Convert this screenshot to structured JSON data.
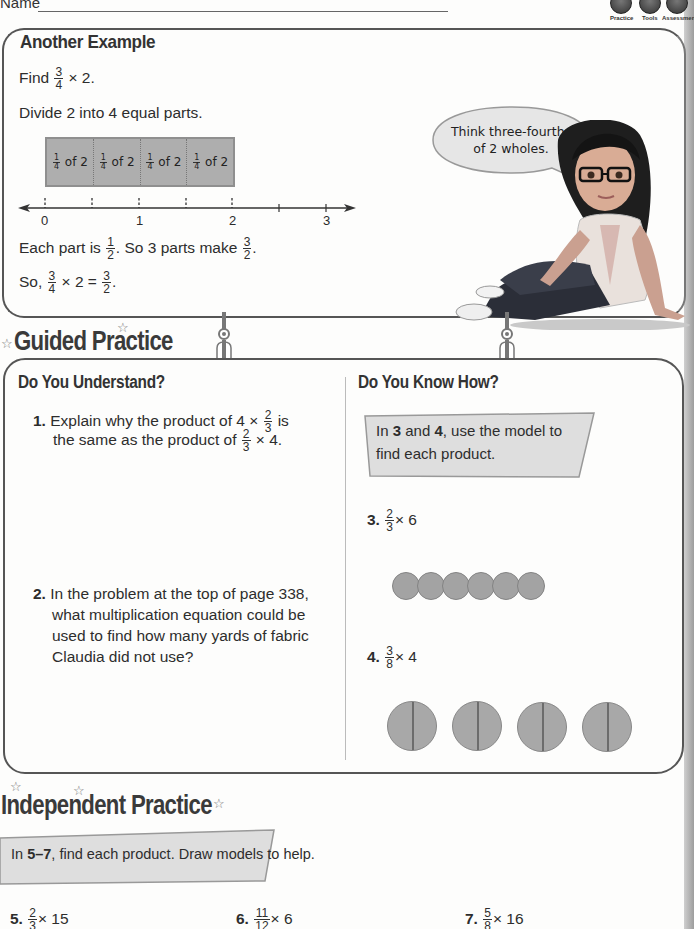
{
  "header": {
    "name_label": "Name",
    "icons": [
      {
        "label": "Practice",
        "icon": "practice-icon"
      },
      {
        "label": "Tools",
        "icon": "tools-icon"
      },
      {
        "label": "Assessment",
        "icon": "assessment-icon"
      }
    ]
  },
  "another_example": {
    "title": "Another Example",
    "find_prefix": "Find",
    "find_frac": {
      "n": "3",
      "d": "4"
    },
    "find_suffix": "× 2.",
    "divide_text": "Divide 2 into 4 equal parts.",
    "tape_segments": [
      {
        "frac": {
          "n": "1",
          "d": "4"
        },
        "text": "of 2"
      },
      {
        "frac": {
          "n": "1",
          "d": "4"
        },
        "text": "of 2"
      },
      {
        "frac": {
          "n": "1",
          "d": "4"
        },
        "text": "of 2"
      },
      {
        "frac": {
          "n": "1",
          "d": "4"
        },
        "text": "of 2"
      }
    ],
    "number_line_labels": [
      "0",
      "1",
      "2",
      "3"
    ],
    "each_part_prefix": "Each part is",
    "each_part_frac": {
      "n": "1",
      "d": "2"
    },
    "each_part_mid": ". So 3 parts make",
    "each_part_frac2": {
      "n": "3",
      "d": "2"
    },
    "each_part_end": ".",
    "so_prefix": "So,",
    "so_frac1": {
      "n": "3",
      "d": "4"
    },
    "so_mid": "× 2 =",
    "so_frac2": {
      "n": "3",
      "d": "2"
    },
    "so_end": ".",
    "speech_bubble": "Think three-fourths of 2 wholes."
  },
  "guided_practice": {
    "title": "Guided Practice",
    "do_you_understand": {
      "title": "Do You Understand?",
      "q1": {
        "num": "1.",
        "line1_prefix": "Explain why the product of 4 ×",
        "frac_a": {
          "n": "2",
          "d": "3"
        },
        "line1_suffix": "is",
        "line2_prefix": "the same as the product of",
        "frac_b": {
          "n": "2",
          "d": "3"
        },
        "line2_suffix": "× 4."
      },
      "q2": {
        "num": "2.",
        "lines": [
          "In the problem at the top of page 338,",
          "what multiplication equation could be",
          "used to find how many yards of fabric",
          "Claudia did not use?"
        ]
      }
    },
    "do_you_know_how": {
      "title": "Do You Know How?",
      "instruction": {
        "p1": "In ",
        "b1": "3",
        "p2": " and ",
        "b2": "4",
        "p3": ", use the model to",
        "line2": "find each product."
      },
      "q3": {
        "num": "3.",
        "frac": {
          "n": "2",
          "d": "3"
        },
        "suffix": "× 6",
        "circles": 6
      },
      "q4": {
        "num": "4.",
        "frac": {
          "n": "3",
          "d": "8"
        },
        "suffix": "× 4",
        "circles": 4
      }
    }
  },
  "independent_practice": {
    "title": "Independent Practice",
    "instruction": {
      "p1": "In ",
      "b1": "5–7",
      "p2": ", find each product. Draw models to help."
    },
    "problems": [
      {
        "num": "5.",
        "frac": {
          "n": "2",
          "d": "3"
        },
        "suffix": "× 15"
      },
      {
        "num": "6.",
        "frac": {
          "n": "11",
          "d": "12"
        },
        "suffix": "× 6"
      },
      {
        "num": "7.",
        "frac": {
          "n": "5",
          "d": "8"
        },
        "suffix": "× 16"
      }
    ]
  }
}
